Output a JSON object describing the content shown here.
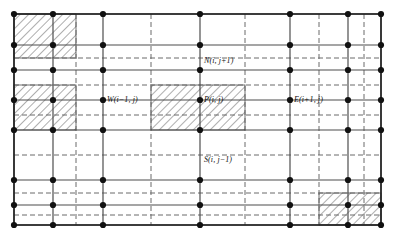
{
  "figure": {
    "type": "finite-volume-grid-diagram",
    "width": 396,
    "height": 235,
    "background_color": "#ffffff"
  },
  "style": {
    "solid_line_color": "#4d4d4d",
    "solid_line_width": 1.2,
    "border_line_color": "#222222",
    "border_line_width": 1.6,
    "dashed_line_color": "#6b6b6b",
    "dashed_line_width": 1.0,
    "dash_pattern": "5,3",
    "node_color": "#111111",
    "node_radius": 3.1,
    "hatch_line_color": "#333333",
    "hatch_line_width": 0.8,
    "hatch_spacing": 6,
    "hatch_angle_deg": 45,
    "label_color": "#111111",
    "label_font_size": 8
  },
  "grid": {
    "node_columns_x": [
      14,
      53,
      103,
      200,
      290,
      348,
      381
    ],
    "node_rows_y": [
      14,
      45,
      70,
      100,
      130,
      180,
      205,
      225
    ],
    "face_columns_x": [
      76,
      151,
      245,
      319,
      364
    ],
    "face_rows_y": [
      58,
      85,
      115,
      155,
      193,
      215
    ],
    "outer_bounds": {
      "left": 14,
      "top": 14,
      "right": 381,
      "bottom": 225
    }
  },
  "hatched_blocks": [
    {
      "name": "block-top-left",
      "x": 14,
      "y": 14,
      "width": 62,
      "height": 44
    },
    {
      "name": "block-mid-left",
      "x": 14,
      "y": 85,
      "width": 62,
      "height": 45
    },
    {
      "name": "block-center-p",
      "x": 151,
      "y": 85,
      "width": 94,
      "height": 45
    },
    {
      "name": "block-bottom-right",
      "x": 319,
      "y": 193,
      "width": 62,
      "height": 32
    }
  ],
  "labels": [
    {
      "id": "label-north",
      "text": "N(i, j+1)",
      "x": 204,
      "y": 57,
      "node_x": 200,
      "node_y": 70
    },
    {
      "id": "label-west",
      "text": "W(i−1, j)",
      "x": 107,
      "y": 96,
      "node_x": 103,
      "node_y": 100
    },
    {
      "id": "label-p",
      "text": "P(i, j)",
      "x": 204,
      "y": 96,
      "node_x": 200,
      "node_y": 100
    },
    {
      "id": "label-east",
      "text": "E(i+1, j)",
      "x": 294,
      "y": 96,
      "node_x": 290,
      "node_y": 100
    },
    {
      "id": "label-south",
      "text": "S(i, j−1)",
      "x": 204,
      "y": 156,
      "node_x": 200,
      "node_y": 180
    }
  ]
}
